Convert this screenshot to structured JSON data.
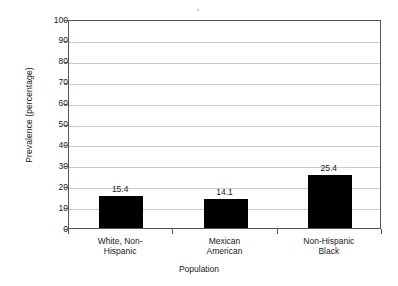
{
  "chart_data": {
    "type": "bar",
    "title": "",
    "subtitle": "",
    "xlabel": "Population",
    "ylabel": "Prevalence (percentage)",
    "categories": [
      "White, Non-\nHispanic",
      "Mexican\nAmerican",
      "Non-Hispanic\nBlack"
    ],
    "category_lines": [
      [
        "White, Non-",
        "Hispanic"
      ],
      [
        "Mexican",
        "American"
      ],
      [
        "Non-Hispanic",
        "Black"
      ]
    ],
    "values": [
      15.4,
      14.1,
      25.4
    ],
    "value_labels": [
      "15.4",
      "14.1",
      "25.4"
    ],
    "ylim": [
      0,
      100
    ],
    "ytick_step": 10,
    "ytick_labels": [
      "100",
      "90",
      "80",
      "70",
      "60",
      "50",
      "40",
      "30",
      "20",
      "10",
      "0"
    ],
    "grid": true,
    "grid_axis": "y",
    "legend": null,
    "legend_position": "none",
    "colors": {
      "bar": "#000000",
      "grid": "#c9c9c9",
      "axis": "#555555",
      "text": "#1a1a1a",
      "background": "#ffffff"
    }
  }
}
